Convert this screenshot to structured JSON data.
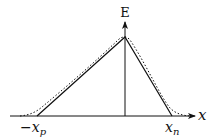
{
  "diagram": {
    "type": "electric-field-profile",
    "axes": {
      "x_label": "x",
      "y_label": "E"
    },
    "markers": {
      "left": {
        "sign": "−",
        "symbol": "x",
        "subscript": "p"
      },
      "right": {
        "symbol": "x",
        "subscript": "n"
      }
    },
    "curves": [
      {
        "name": "triangular-approximation",
        "style": "solid"
      },
      {
        "name": "actual-field",
        "style": "dotted"
      }
    ],
    "colors": {
      "line": "#111111",
      "background": "#ffffff"
    }
  }
}
